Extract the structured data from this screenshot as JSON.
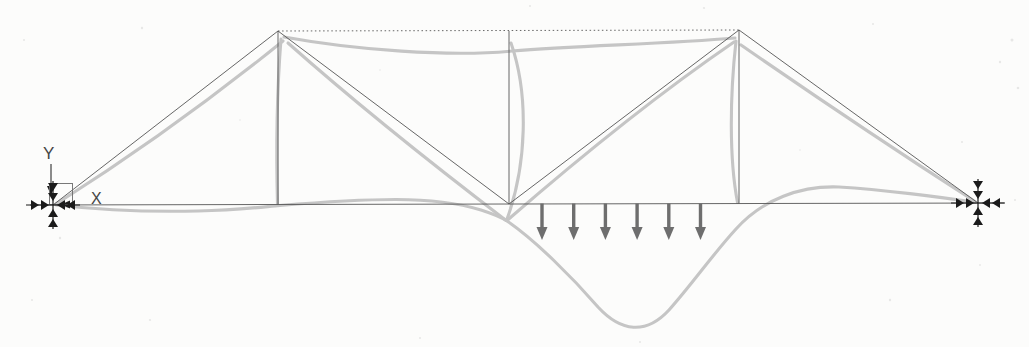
{
  "colors": {
    "background": "#fcfcfb",
    "undeformed": "#575757",
    "deformed": "#c5c5c5",
    "symbols": "#1b1b1b",
    "loads": "#6e6e6e",
    "labels": "#454545"
  },
  "axes": {
    "y_label": "Y",
    "x_label": "X",
    "y_line": {
      "x1": 51,
      "y1": 164,
      "x2": 51,
      "y2": 186
    },
    "y_arrow": [
      [
        47,
        186
      ],
      [
        55,
        186
      ],
      [
        51,
        195
      ]
    ],
    "x_arrow": [
      [
        70,
        200.5
      ],
      [
        70,
        208.5
      ],
      [
        61,
        204.5
      ]
    ],
    "origin_box": {
      "x": 49.5,
      "y": 183.5,
      "w": 23,
      "h": 21
    }
  },
  "truss": {
    "members": [
      {
        "id": "baseline-bottom-chord",
        "x1": 30,
        "y1": 205,
        "x2": 1004,
        "y2": 203
      },
      {
        "id": "end-post-left",
        "x1": 53,
        "y1": 205,
        "x2": 278,
        "y2": 31
      },
      {
        "id": "vertical-left",
        "x1": 278,
        "y1": 31,
        "x2": 278,
        "y2": 204.5
      },
      {
        "id": "diagonal-left-to-midspan",
        "x1": 278,
        "y1": 31,
        "x2": 509,
        "y2": 204
      },
      {
        "id": "vertical-center",
        "x1": 509,
        "y1": 31,
        "x2": 509,
        "y2": 204
      },
      {
        "id": "diagonal-midspan-to-right",
        "x1": 509,
        "y1": 204,
        "x2": 739,
        "y2": 30
      },
      {
        "id": "vertical-right",
        "x1": 739,
        "y1": 30,
        "x2": 739,
        "y2": 203.5
      },
      {
        "id": "end-post-right",
        "x1": 739,
        "y1": 30,
        "x2": 978,
        "y2": 203
      },
      {
        "id": "top-chord",
        "x1": 278,
        "y1": 31,
        "x2": 739,
        "y2": 30,
        "dash": "1.5 2.6"
      }
    ]
  },
  "deformed": {
    "stroke_width": 3.1,
    "paths": [
      {
        "id": "deformed-end-post-left",
        "d": "M56,204 Q173,130 283,41"
      },
      {
        "id": "deformed-vertical-left",
        "d": "M281,39 C277,90 276,150 277.5,204"
      },
      {
        "id": "deformed-top-chord",
        "d": "M284,37 C355,50 450,57 512,51 C578,45.5 665,44 735,38"
      },
      {
        "id": "deformed-diagonal-left-to-midspan",
        "d": "M288,43 C350,98 440,170 505.5,220"
      },
      {
        "id": "deformed-vertical-center",
        "d": "M511,43 C529,95 527,165 506.5,220.5"
      },
      {
        "id": "deformed-diagonal-midspan-to-right",
        "d": "M507,220.5 C572,164 655,96 734,42"
      },
      {
        "id": "deformed-vertical-right",
        "d": "M736,41 C730,95 729,158 737.5,202.5"
      },
      {
        "id": "deformed-end-post-right",
        "d": "M741,45 Q858,126 975,201.5"
      },
      {
        "id": "deformed-bottom-chord",
        "d": "M56,205 C105,210.5 155,212 198,211 C238,210 262,207 280,205.5 C322,202 362,199.5 396,199.5 C432,199.5 458,203 481,210 C495,214.5 501,217 507,221 C536,241 572,277 598,307 C621,332 646,335 669,310 C693,283 713,254 736,229 C763,199 801,185.5 839,187 C881,189.5 941,197 975,202.5"
      }
    ]
  },
  "supports": [
    {
      "id": "support-left",
      "x": 53,
      "y": 205
    },
    {
      "id": "support-right",
      "x": 978,
      "y": 203
    }
  ],
  "support_style": {
    "arm_vertical": 24,
    "arm_horizontal": 27,
    "triangle_width": 10,
    "triangle_height": 8
  },
  "loads": {
    "arrow_count": 6,
    "x_positions": [
      542,
      573.7,
      605.4,
      637.1,
      668.8,
      700.5
    ],
    "y_start": 203.5,
    "y_tip": 240,
    "head_width": 11,
    "head_height": 13,
    "shaft_width": 3.4
  },
  "speckles": [
    [
      142,
      28,
      1.2
    ],
    [
      530,
      6,
      1
    ],
    [
      704,
      8,
      1.1
    ],
    [
      873,
      24,
      1
    ],
    [
      1012,
      40,
      1.5
    ],
    [
      1000,
      62,
      1.2
    ],
    [
      1018,
      88,
      1.3
    ],
    [
      962,
      142,
      1
    ],
    [
      1015,
      200,
      1
    ],
    [
      60,
      238,
      1.2
    ],
    [
      32,
      300,
      1
    ],
    [
      150,
      320,
      1.1
    ],
    [
      420,
      338,
      1
    ],
    [
      640,
      342,
      1
    ],
    [
      890,
      300,
      1.2
    ],
    [
      240,
      120,
      0.8
    ],
    [
      800,
      150,
      0.8
    ],
    [
      380,
      70,
      0.8
    ],
    [
      24,
      40,
      1
    ],
    [
      980,
      265,
      0.9
    ]
  ]
}
